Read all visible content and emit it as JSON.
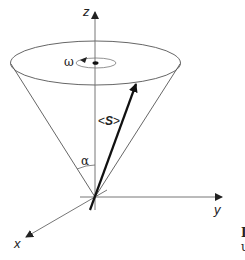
{
  "diagram": {
    "type": "spin precession cone",
    "axes": {
      "z_label": "z",
      "y_label": "y",
      "x_label": "x"
    },
    "labels": {
      "omega": "ω",
      "alpha": "α",
      "spin_open": "<",
      "spin_symbol": "S",
      "spin_close": ">"
    },
    "edge_text": {
      "line1": "I",
      "line2": "u"
    },
    "colors": {
      "line": "#555555",
      "arrow": "#111111",
      "background": "#ffffff"
    }
  }
}
